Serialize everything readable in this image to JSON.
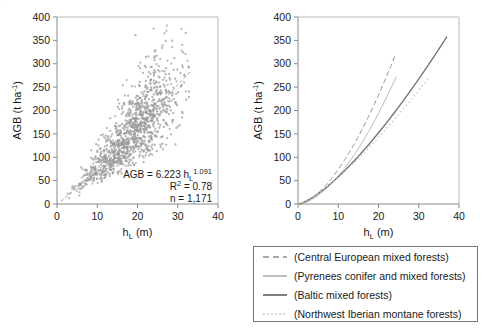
{
  "figure": {
    "corner_mark": "'"
  },
  "chart_data": [
    {
      "type": "scatter",
      "panel": "left",
      "title": "",
      "xlabel": "h_L (m)",
      "xlabel_parts": {
        "base": "h",
        "sub": "L",
        "unit": "(m)"
      },
      "ylabel": "AGB (t ha-1)",
      "ylabel_parts": {
        "base": "AGB (t ha",
        "sup": "-1",
        "tail": ")"
      },
      "xlim": [
        0,
        40
      ],
      "ylim": [
        0,
        400
      ],
      "xticks": [
        0,
        10,
        20,
        30,
        40
      ],
      "yticks": [
        0,
        50,
        100,
        150,
        200,
        250,
        300,
        350,
        400
      ],
      "grid": false,
      "n_points": 1171,
      "point_color": "#9a9a9a",
      "annotations": {
        "equation_base": "AGB = 6.223 h",
        "equation_sub": "L",
        "equation_sup": "1.091",
        "r_squared_base": "R",
        "r_squared_sup": "2",
        "r_squared_value": "= 0.78",
        "n_label": "n = 1,171"
      },
      "fit": {
        "coefficient": 6.223,
        "exponent": 1.091,
        "r_squared": 0.78,
        "n": 1171,
        "line_style": "dashed",
        "line_color": "#9a9a9a",
        "x_range": [
          1,
          33
        ]
      },
      "scatter_model": {
        "x_min": 0.8,
        "x_max": 33,
        "x_mode": 14,
        "residual_sd_frac": 0.26
      }
    },
    {
      "type": "line",
      "panel": "right",
      "title": "",
      "xlabel": "h_L (m)",
      "xlabel_parts": {
        "base": "h",
        "sub": "L",
        "unit": "(m)"
      },
      "ylabel": "AGB (t ha-1)",
      "ylabel_parts": {
        "base": "AGB (t ha",
        "sup": "-1",
        "tail": ")"
      },
      "xlim": [
        0,
        40
      ],
      "ylim": [
        0,
        400
      ],
      "xticks": [
        0,
        10,
        20,
        30,
        40
      ],
      "yticks": [
        0,
        50,
        100,
        150,
        200,
        250,
        300,
        350,
        400
      ],
      "grid": false,
      "legend_position": "below",
      "series": [
        {
          "name": "(Central European mixed forests)",
          "coefficient": 1.62,
          "exponent": 1.66,
          "x_end": 24.2,
          "y_end": 320,
          "style": "dashed",
          "color": "#8c8c8c",
          "width": 1.0,
          "dash": "5,3"
        },
        {
          "name": "(Pyrenees conifer and mixed forests)",
          "coefficient": 1.28,
          "exponent": 1.7,
          "x_end": 24.4,
          "y_end": 272,
          "style": "solid-thin",
          "color": "#b4b4b4",
          "width": 1.0,
          "dash": ""
        },
        {
          "name": "(Baltic mixed forests)",
          "coefficient": 2.35,
          "exponent": 1.39,
          "x_end": 37.0,
          "y_end": 358,
          "style": "solid-thick",
          "color": "#6e6e6e",
          "width": 1.3,
          "dash": ""
        },
        {
          "name": "(Northwest Iberian montane forests)",
          "coefficient": 2.55,
          "exponent": 1.32,
          "x_end": 32.3,
          "y_end": 268,
          "style": "dotted",
          "color": "#c0c0c0",
          "width": 1.1,
          "dash": "1.6,2.6"
        }
      ]
    }
  ],
  "legend": {
    "items": [
      {
        "label": "(Central European mixed forests)",
        "icon": "dashed-line-swatch"
      },
      {
        "label": "(Pyrenees conifer and mixed forests)",
        "icon": "thin-solid-line-swatch"
      },
      {
        "label": "(Baltic mixed forests)",
        "icon": "thick-solid-line-swatch"
      },
      {
        "label": "(Northwest Iberian montane forests)",
        "icon": "dotted-line-swatch"
      }
    ]
  }
}
